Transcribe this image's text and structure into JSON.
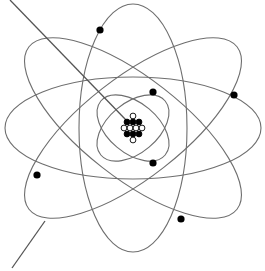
{
  "diagram": {
    "title": "",
    "colors": {
      "background": "#ffffff",
      "orbit_stroke": "#6e6e6e",
      "line_stroke": "#555555",
      "electron_fill": "#000000",
      "proton_fill": "#000000",
      "neutron_fill": "#ffffff",
      "nucleon_stroke": "#000000"
    },
    "center": {
      "x": 133,
      "y": 128
    },
    "orbits": [
      {
        "name": "inner-orbit-a",
        "rx": 42,
        "ry": 25,
        "rotate": 40
      },
      {
        "name": "inner-orbit-b",
        "rx": 42,
        "ry": 25,
        "rotate": -40
      },
      {
        "name": "outer-orbit-vertical",
        "rx": 54,
        "ry": 124,
        "rotate": 0
      },
      {
        "name": "outer-orbit-horizontal",
        "rx": 128,
        "ry": 51,
        "rotate": 0
      },
      {
        "name": "outer-orbit-diagonal-a",
        "rx": 132,
        "ry": 50,
        "rotate": 38
      },
      {
        "name": "outer-orbit-diagonal-b",
        "rx": 132,
        "ry": 50,
        "rotate": -38
      }
    ],
    "electrons": [
      {
        "x": 100,
        "y": 30
      },
      {
        "x": 234,
        "y": 95
      },
      {
        "x": 181,
        "y": 219
      },
      {
        "x": 37,
        "y": 175
      },
      {
        "x": 153,
        "y": 92
      },
      {
        "x": 153,
        "y": 163
      }
    ],
    "nucleons": [
      {
        "type": "neutron",
        "x": 133,
        "y": 116
      },
      {
        "type": "proton",
        "x": 127,
        "y": 122
      },
      {
        "type": "proton",
        "x": 133,
        "y": 122
      },
      {
        "type": "proton",
        "x": 139,
        "y": 122
      },
      {
        "type": "neutron",
        "x": 124,
        "y": 128
      },
      {
        "type": "neutron",
        "x": 130,
        "y": 128
      },
      {
        "type": "neutron",
        "x": 136,
        "y": 128
      },
      {
        "type": "neutron",
        "x": 142,
        "y": 128
      },
      {
        "type": "proton",
        "x": 127,
        "y": 134
      },
      {
        "type": "proton",
        "x": 133,
        "y": 134
      },
      {
        "type": "proton",
        "x": 139,
        "y": 134
      },
      {
        "type": "neutron",
        "x": 133,
        "y": 140
      }
    ],
    "pointer_lines": [
      {
        "name": "pointer-line-nucleus",
        "x1": 10,
        "y1": 0,
        "x2": 126,
        "y2": 120
      },
      {
        "name": "pointer-line-orbit",
        "x1": 12,
        "y1": 268,
        "x2": 45,
        "y2": 221
      }
    ],
    "counts": {
      "electrons": 6,
      "protons": 6,
      "neutrons": 6
    }
  }
}
